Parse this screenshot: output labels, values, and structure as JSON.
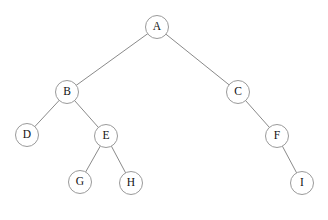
{
  "diagram": {
    "type": "binary-tree",
    "canvas": {
      "width": 328,
      "height": 220,
      "background": "#ffffff"
    },
    "style": {
      "node_radius": 11.5,
      "node_fill": "#ffffff",
      "node_stroke": "#9a9a9a",
      "edge_stroke": "#8a8a8a",
      "edge_width": 1,
      "label_color": "#111111",
      "label_size": 11.5
    },
    "root": "A",
    "nodes": [
      {
        "id": "A",
        "label": "A",
        "x": 157,
        "y": 27,
        "depth": 0
      },
      {
        "id": "B",
        "label": "B",
        "x": 67,
        "y": 92,
        "depth": 1
      },
      {
        "id": "C",
        "label": "C",
        "x": 238,
        "y": 92,
        "depth": 1
      },
      {
        "id": "D",
        "label": "D",
        "x": 27,
        "y": 135,
        "depth": 2
      },
      {
        "id": "E",
        "label": "E",
        "x": 106,
        "y": 136,
        "depth": 2
      },
      {
        "id": "F",
        "label": "F",
        "x": 277,
        "y": 136,
        "depth": 2
      },
      {
        "id": "G",
        "label": "G",
        "x": 80,
        "y": 182,
        "depth": 3
      },
      {
        "id": "H",
        "label": "H",
        "x": 131,
        "y": 183,
        "depth": 3
      },
      {
        "id": "I",
        "label": "I",
        "x": 302,
        "y": 183,
        "depth": 3
      }
    ],
    "edges": [
      {
        "from": "A",
        "to": "B",
        "side": "left"
      },
      {
        "from": "A",
        "to": "C",
        "side": "right"
      },
      {
        "from": "B",
        "to": "D",
        "side": "left"
      },
      {
        "from": "B",
        "to": "E",
        "side": "right"
      },
      {
        "from": "C",
        "to": "F",
        "side": "right"
      },
      {
        "from": "E",
        "to": "G",
        "side": "left"
      },
      {
        "from": "E",
        "to": "H",
        "side": "right"
      },
      {
        "from": "F",
        "to": "I",
        "side": "right"
      }
    ]
  }
}
